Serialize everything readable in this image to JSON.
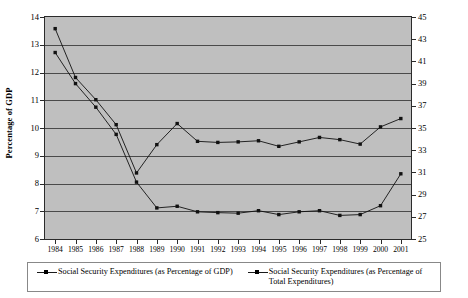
{
  "chart_data": {
    "type": "line",
    "title": "",
    "xlabel": "",
    "ylabel": "Percentage of GDP",
    "y2label": "Percentage of Total Spending",
    "grid": true,
    "legend_position": "bottom",
    "ylim": [
      6,
      14
    ],
    "ytick_step": 1,
    "y2lim": [
      25,
      45
    ],
    "y2tick_step": 2,
    "categories": [
      "1984",
      "1985",
      "1986",
      "1987",
      "1988",
      "1989",
      "1990",
      "1991",
      "1992",
      "1993",
      "1994",
      "1995",
      "1996",
      "1997",
      "1998",
      "1999",
      "2000",
      "2001"
    ],
    "yticks": [
      "6",
      "7",
      "8",
      "9",
      "10",
      "11",
      "12",
      "13",
      "14"
    ],
    "y2ticks": [
      "25",
      "27",
      "29",
      "31",
      "33",
      "35",
      "37",
      "39",
      "41",
      "43",
      "45"
    ],
    "series": [
      {
        "name": "Social Security Expenditures (as Percentage of GDP)",
        "axis": "left",
        "marker": "square",
        "color": "#111111",
        "values": [
          12.72,
          11.6,
          10.75,
          9.77,
          8.05,
          7.12,
          7.18,
          6.98,
          6.95,
          6.93,
          7.02,
          6.88,
          6.98,
          7.02,
          6.85,
          6.88,
          7.2,
          8.35
        ]
      },
      {
        "name": "Social Security Expenditures (as Percentage of Total Expenditures)",
        "axis": "right",
        "marker": "square",
        "color": "#111111",
        "values": [
          43.95,
          39.55,
          37.55,
          35.3,
          30.95,
          33.5,
          35.4,
          33.8,
          33.7,
          33.75,
          33.85,
          33.35,
          33.75,
          34.15,
          33.95,
          33.55,
          35.1,
          35.85
        ]
      }
    ]
  },
  "legend": {
    "entries": [
      {
        "label": "Social Security Expenditures (as Percentage of GDP)"
      },
      {
        "label": "Social Security Expenditures (as Percentage of Total Expenditures)"
      }
    ]
  },
  "axes": {
    "left_title": "Percentage of GDP",
    "right_title": "Percentage of Total Spending"
  }
}
